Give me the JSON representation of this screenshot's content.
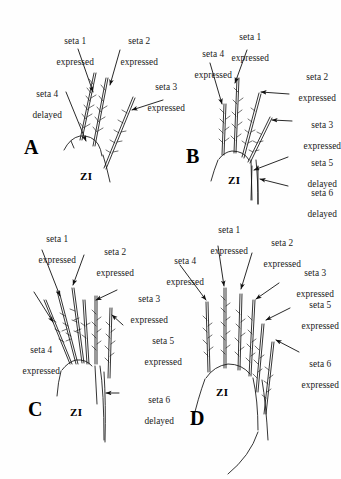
{
  "figure": {
    "background": "#fefefe",
    "ink": "#111111",
    "panel_count": 4
  },
  "panels": [
    {
      "id": "A",
      "letter": "A",
      "zi_label": "ZI",
      "labels": [
        {
          "key": "a1",
          "line1": "seta 1",
          "line2": "expressed"
        },
        {
          "key": "a2",
          "line1": "seta 2",
          "line2": "expressed"
        },
        {
          "key": "a3",
          "line1": "seta 3",
          "line2": "expressed"
        },
        {
          "key": "a4",
          "line1": "seta 4",
          "line2": "delayed"
        }
      ]
    },
    {
      "id": "B",
      "letter": "B",
      "zi_label": "ZI",
      "labels": [
        {
          "key": "b1",
          "line1": "seta 1",
          "line2": "expressed"
        },
        {
          "key": "b2",
          "line1": "seta 2",
          "line2": "expressed"
        },
        {
          "key": "b3",
          "line1": "seta 3",
          "line2": "expressed"
        },
        {
          "key": "b4",
          "line1": "seta 4",
          "line2": "expressed"
        },
        {
          "key": "b5",
          "line1": "seta 5",
          "line2": "delayed"
        },
        {
          "key": "b6",
          "line1": "seta 6",
          "line2": "delayed"
        }
      ]
    },
    {
      "id": "C",
      "letter": "C",
      "zi_label": "ZI",
      "labels": [
        {
          "key": "c1",
          "line1": "seta 1",
          "line2": "expressed"
        },
        {
          "key": "c2",
          "line1": "seta 2",
          "line2": "expressed"
        },
        {
          "key": "c3",
          "line1": "seta 3",
          "line2": "expressed"
        },
        {
          "key": "c4",
          "line1": "seta 4",
          "line2": "expressed"
        },
        {
          "key": "c5",
          "line1": "seta 5",
          "line2": "expressed"
        },
        {
          "key": "c6",
          "line1": "seta 6",
          "line2": "delayed"
        }
      ]
    },
    {
      "id": "D",
      "letter": "D",
      "zi_label": "ZI",
      "labels": [
        {
          "key": "d1",
          "line1": "seta 1",
          "line2": "expressed"
        },
        {
          "key": "d2",
          "line1": "seta 2",
          "line2": "expressed"
        },
        {
          "key": "d3",
          "line1": "seta 3",
          "line2": "expressed"
        },
        {
          "key": "d4",
          "line1": "seta 4",
          "line2": "expressed"
        },
        {
          "key": "d5",
          "line1": "seta 5",
          "line2": "expressed"
        },
        {
          "key": "d6",
          "line1": "seta 6",
          "line2": "expressed"
        }
      ]
    }
  ]
}
